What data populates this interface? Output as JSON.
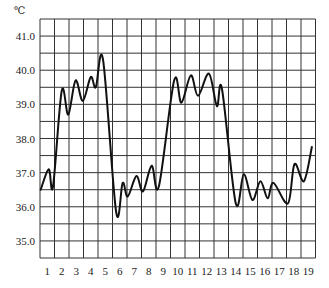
{
  "chart_data": {
    "type": "line",
    "title": "",
    "unit_label": "℃",
    "xlabel": "",
    "ylabel": "℃",
    "x_tick_labels": [
      "1",
      "2",
      "3",
      "4",
      "5",
      "6",
      "7",
      "8",
      "9",
      "10",
      "11",
      "12",
      "13",
      "14",
      "15",
      "16",
      "17",
      "18",
      "19"
    ],
    "y_tick_labels": [
      "41.0",
      "40.0",
      "39.0",
      "38.0",
      "37.0",
      "36.0",
      "35.0"
    ],
    "y_tick_values": [
      41.0,
      40.0,
      39.0,
      38.0,
      37.0,
      36.0,
      35.0
    ],
    "ylim": [
      34.5,
      41.5
    ],
    "xlim": [
      0.5,
      19.5
    ],
    "grid": true,
    "grid_minor_y_step": 0.5,
    "line_color": "#111111",
    "grid_color": "#333333",
    "series": [
      {
        "name": "temperature",
        "points": [
          [
            0.55,
            36.5
          ],
          [
            1.1,
            37.1
          ],
          [
            1.4,
            36.6
          ],
          [
            2.0,
            39.4
          ],
          [
            2.45,
            38.7
          ],
          [
            2.95,
            39.7
          ],
          [
            3.45,
            39.1
          ],
          [
            4.0,
            39.8
          ],
          [
            4.35,
            39.5
          ],
          [
            4.85,
            40.3
          ],
          [
            5.75,
            35.85
          ],
          [
            6.2,
            36.7
          ],
          [
            6.55,
            36.3
          ],
          [
            7.15,
            36.9
          ],
          [
            7.6,
            36.45
          ],
          [
            8.2,
            37.2
          ],
          [
            8.7,
            36.6
          ],
          [
            9.75,
            39.7
          ],
          [
            10.25,
            39.05
          ],
          [
            10.9,
            39.85
          ],
          [
            11.4,
            39.25
          ],
          [
            12.15,
            39.9
          ],
          [
            12.7,
            38.95
          ],
          [
            13.05,
            39.45
          ],
          [
            14.0,
            36.1
          ],
          [
            14.55,
            36.95
          ],
          [
            15.15,
            36.2
          ],
          [
            15.7,
            36.75
          ],
          [
            16.2,
            36.25
          ],
          [
            16.6,
            36.7
          ],
          [
            17.6,
            36.1
          ],
          [
            18.05,
            37.25
          ],
          [
            18.7,
            36.75
          ],
          [
            19.25,
            37.75
          ]
        ]
      }
    ]
  }
}
